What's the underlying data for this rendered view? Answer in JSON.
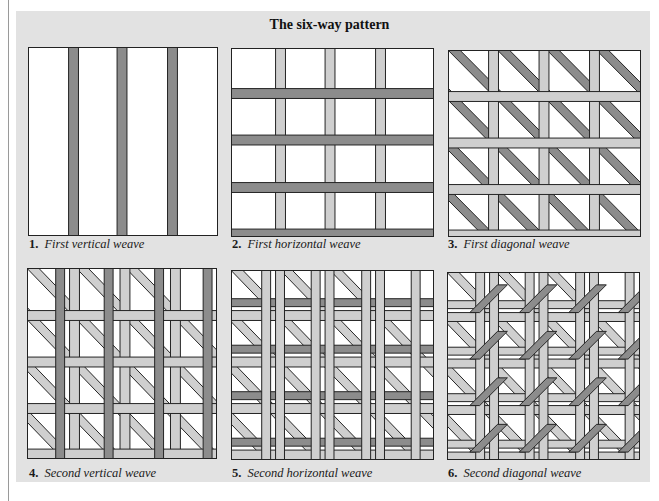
{
  "title": "The six-way pattern",
  "colors": {
    "background_panel": "#e2e2e2",
    "dark_strand": "#8c8c8c",
    "light_strand": "#cfcfcf",
    "outline": "#222222",
    "hole": "#ffffff"
  },
  "figures": [
    {
      "number": "1.",
      "caption": "First vertical weave"
    },
    {
      "number": "2.",
      "caption": "First horizontal weave"
    },
    {
      "number": "3.",
      "caption": "First diagonal weave"
    },
    {
      "number": "4.",
      "caption": "Second vertical weave"
    },
    {
      "number": "5.",
      "caption": "Second horizontal weave"
    },
    {
      "number": "6.",
      "caption": "Second diagonal weave"
    }
  ]
}
